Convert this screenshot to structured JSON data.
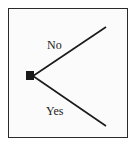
{
  "diagram": {
    "type": "decision-tree",
    "colors": {
      "line": "#1a1a1a",
      "node": "#1a1a1a",
      "border": "#2a2a2a",
      "background": "#fbfbfb",
      "text": "#222222"
    },
    "root_node": {
      "shape": "square"
    },
    "branches": [
      {
        "label": "No",
        "direction": "up"
      },
      {
        "label": "Yes",
        "direction": "down"
      }
    ]
  }
}
